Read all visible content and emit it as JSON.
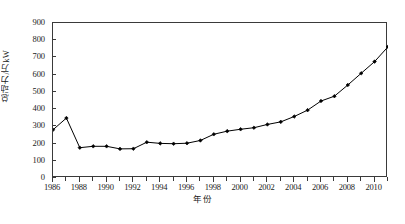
{
  "chart_data": {
    "type": "line",
    "title": "",
    "xlabel": "年份",
    "ylabel": "总动力/万kW",
    "xlim": [
      1986,
      2011
    ],
    "ylim": [
      0,
      900
    ],
    "grid": false,
    "legend": "none",
    "marker": "filled-diamond",
    "line_color": "#000000",
    "x": [
      1986,
      1987,
      1988,
      1989,
      1990,
      1991,
      1992,
      1993,
      1994,
      1995,
      1996,
      1997,
      1998,
      1999,
      2000,
      2001,
      2002,
      2003,
      2004,
      2005,
      2006,
      2007,
      2008,
      2009,
      2010,
      2011
    ],
    "values": [
      280,
      348,
      176,
      184,
      184,
      169,
      170,
      208,
      201,
      199,
      202,
      218,
      254,
      272,
      283,
      292,
      311,
      326,
      357,
      394,
      447,
      475,
      540,
      608,
      676,
      762
    ],
    "x_tick_labels": [
      "1986",
      "1988",
      "1990",
      "1992",
      "1994",
      "1996",
      "1998",
      "2000",
      "2002",
      "2004",
      "2006",
      "2008",
      "2010"
    ],
    "x_tick_values": [
      1986,
      1988,
      1990,
      1992,
      1994,
      1996,
      1998,
      2000,
      2002,
      2004,
      2006,
      2008,
      2010
    ],
    "x_minor_tick_values": [
      1987,
      1989,
      1991,
      1993,
      1995,
      1997,
      1999,
      2001,
      2003,
      2005,
      2007,
      2009,
      2011
    ],
    "y_tick_labels": [
      "0",
      "100",
      "200",
      "300",
      "400",
      "500",
      "600",
      "700",
      "800",
      "900"
    ],
    "y_tick_values": [
      0,
      100,
      200,
      300,
      400,
      500,
      600,
      700,
      800,
      900
    ]
  },
  "caption": ""
}
